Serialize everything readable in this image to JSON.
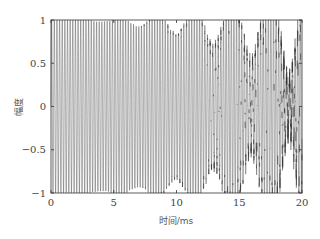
{
  "chart_data": {
    "type": "line",
    "title": "",
    "xlabel": "时间/ms",
    "ylabel": "幅度",
    "xlim": [
      0,
      20
    ],
    "ylim": [
      -1,
      1
    ],
    "xticks": [
      0,
      5,
      10,
      15,
      20
    ],
    "xtick_labels": [
      "0",
      "5",
      "10",
      "15",
      "20"
    ],
    "yticks": [
      1,
      0.5,
      0,
      -0.5,
      -1
    ],
    "ytick_labels": [
      "1",
      "0.5",
      "0",
      "-0.5",
      "-1"
    ],
    "grid": false,
    "legend": null,
    "series": [
      {
        "name": "signal",
        "description": "High-frequency oscillation with amplitude ~1 spanning the full [-1,1] range; waveform becomes increasingly dense/noisy toward 15-20 ms",
        "amplitude": 1.0,
        "approx_cycles_in_window": 95,
        "color": "#333333"
      }
    ]
  },
  "axes": {
    "x_label": "时间/ms",
    "y_label": "幅度"
  }
}
